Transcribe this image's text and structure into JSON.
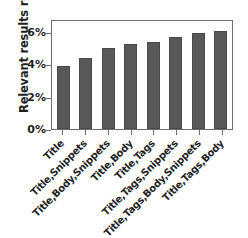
{
  "chart_data": {
    "type": "bar",
    "title": "",
    "xlabel": "",
    "ylabel": "Relevant results retrieved",
    "categories": [
      "Title",
      "Title,Snippets",
      "Title,Body,Snippets",
      "Title,Body",
      "Title,Tags",
      "Title,Tags,Snippets",
      "Title,Tags,Body,Snippets",
      "Title,Tags,Body"
    ],
    "values": [
      3.9,
      4.4,
      5.0,
      5.25,
      5.4,
      5.7,
      5.95,
      6.05
    ],
    "value_unit": "%",
    "ylim": [
      0,
      6.8
    ],
    "yticks": [
      0,
      2,
      4,
      6
    ],
    "ytick_labels": [
      "0%",
      "2%",
      "4%",
      "6%"
    ],
    "grid": false,
    "legend": null,
    "bar_color": "#585858",
    "axis_color": "#6e6e6e",
    "text_color": "#1f1f1f"
  }
}
